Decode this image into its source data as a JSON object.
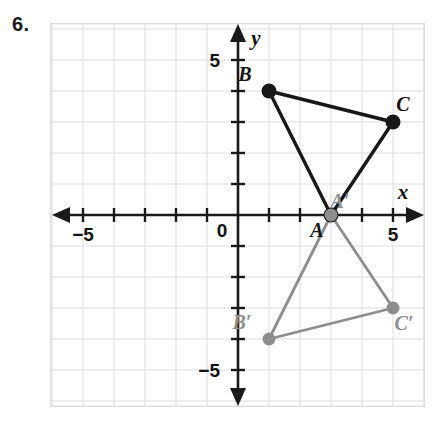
{
  "problem": {
    "number_label": "6."
  },
  "chart_data": {
    "type": "scatter",
    "title": "",
    "subtitle": "",
    "xlabel": "x",
    "ylabel": "y",
    "xlim": [
      -6,
      6
    ],
    "ylim": [
      -6,
      6
    ],
    "grid": true,
    "grid_step": 1,
    "legend_position": "none",
    "axis": {
      "x_name": "x",
      "y_name": "y",
      "origin_label": "0",
      "x_tick_labels": [
        {
          "value": -5,
          "text": "−5"
        },
        {
          "value": 5,
          "text": "5"
        }
      ],
      "y_tick_labels": [
        {
          "value": 5,
          "text": "5"
        },
        {
          "value": -5,
          "text": "−5"
        }
      ],
      "tick_values": [
        -5,
        -4,
        -3,
        -2,
        -1,
        1,
        2,
        3,
        4,
        5
      ],
      "arrows": [
        "left",
        "right",
        "up",
        "down"
      ]
    },
    "series": [
      {
        "name": "Preimage triangle ABC",
        "color": "#17181a",
        "closed": true,
        "points": [
          {
            "label": "A",
            "x": 3,
            "y": 0,
            "label_dx": -14,
            "label_dy": 22
          },
          {
            "label": "B",
            "x": 1,
            "y": 4,
            "label_dx": -24,
            "label_dy": -10
          },
          {
            "label": "C",
            "x": 5,
            "y": 3,
            "label_dx": 10,
            "label_dy": -11
          }
        ]
      },
      {
        "name": "Image triangle A'B'C'",
        "color": "#8b8d8f",
        "closed": true,
        "points": [
          {
            "label": "A′",
            "x": 3,
            "y": 0,
            "label_dx": 9,
            "label_dy": -7
          },
          {
            "label": "B′",
            "x": 1,
            "y": -4,
            "label_dx": -27,
            "label_dy": -10
          },
          {
            "label": "C′",
            "x": 5,
            "y": -3,
            "label_dx": 11,
            "label_dy": 22
          }
        ]
      }
    ]
  }
}
